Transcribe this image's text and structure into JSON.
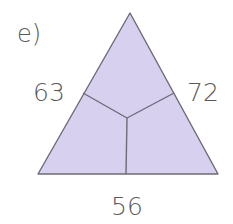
{
  "exercise": {
    "part_label": "e)",
    "left_side_value": "63",
    "right_side_value": "72",
    "bottom_side_value": "56"
  },
  "colors": {
    "fill": "#d8d0ef",
    "stroke": "#6e6a78",
    "text": "#5a5a5a"
  }
}
